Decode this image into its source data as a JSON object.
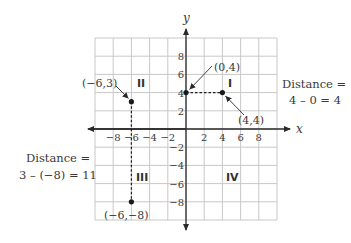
{
  "diagram": {
    "type": "coordinate-plane",
    "x_axis": {
      "label": "x",
      "tick_labels": [
        "−8",
        "−6",
        "−4",
        "−2",
        "2",
        "4",
        "6",
        "8"
      ],
      "tick_values": [
        -8,
        -6,
        -4,
        -2,
        2,
        4,
        6,
        8
      ]
    },
    "y_axis": {
      "label": "y",
      "tick_labels": [
        "8",
        "6",
        "4",
        "2",
        "−2",
        "−4",
        "−6",
        "−8"
      ],
      "tick_values": [
        8,
        6,
        4,
        2,
        -2,
        -4,
        -6,
        -8
      ]
    },
    "grid": {
      "min": -10,
      "max": 10,
      "step": 2
    },
    "quadrants": [
      {
        "name": "I",
        "label": "I"
      },
      {
        "name": "II",
        "label": "II"
      },
      {
        "name": "III",
        "label": "III"
      },
      {
        "name": "IV",
        "label": "IV"
      }
    ],
    "points": [
      {
        "id": "p1",
        "label": "(−6,3)",
        "x": -6,
        "y": 3
      },
      {
        "id": "p2",
        "label": "(0,4)",
        "x": 0,
        "y": 4
      },
      {
        "id": "p3",
        "label": "(4,4)",
        "x": 4,
        "y": 4
      },
      {
        "id": "p4",
        "label": "(−6,−8)",
        "x": -6,
        "y": -8
      }
    ],
    "segments": [
      {
        "from": "p2",
        "to": "p3",
        "style": "dashed"
      },
      {
        "from": "p1",
        "to": "p4",
        "style": "dashed"
      }
    ],
    "annotations": {
      "horizontal_distance": {
        "line1": "Distance =",
        "line2": "4 – 0 = 4"
      },
      "vertical_distance": {
        "line1": "Distance =",
        "line2": "3 – (−8) = 11"
      }
    },
    "colors": {
      "grid": "#c8c8c8",
      "axis": "#2a2a2a",
      "point": "#1a1a1a",
      "text": "#3a3a3a"
    }
  }
}
